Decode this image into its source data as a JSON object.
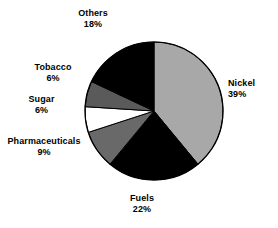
{
  "chart_data": {
    "type": "pie",
    "title": "",
    "subtitle": "",
    "xlabel": "",
    "ylabel": "",
    "legend_position": "none",
    "grid": false,
    "value_unit": "%",
    "categories": [
      "Nickel",
      "Fuels",
      "Pharmaceuticals",
      "Sugar",
      "Tobacco",
      "Others"
    ],
    "values": [
      39,
      22,
      9,
      6,
      6,
      18
    ],
    "labels": [
      "39%",
      "22%",
      "9%",
      "6%",
      "6%",
      "18%"
    ],
    "colors": [
      "#a8a8a8",
      "#000000",
      "#696969",
      "#ffffff",
      "#5a5a5a",
      "#000000"
    ],
    "start_angle_deg": 0,
    "direction": "clockwise",
    "slices": [
      {
        "name": "Nickel",
        "value": 39,
        "label": "39%",
        "color": "#a8a8a8",
        "text_align": "left"
      },
      {
        "name": "Fuels",
        "value": 22,
        "label": "22%",
        "color": "#000000",
        "text_align": "center"
      },
      {
        "name": "Pharmaceuticals",
        "value": 9,
        "label": "9%",
        "color": "#696969",
        "text_align": "center"
      },
      {
        "name": "Sugar",
        "value": 6,
        "label": "6%",
        "color": "#ffffff",
        "text_align": "center"
      },
      {
        "name": "Tobacco",
        "value": 6,
        "label": "6%",
        "color": "#5a5a5a",
        "text_align": "center"
      },
      {
        "name": "Others",
        "value": 18,
        "label": "18%",
        "color": "#000000",
        "text_align": "center"
      }
    ],
    "geometry": {
      "cx": 154,
      "cy": 111,
      "r": 69
    },
    "background": "#ffffff",
    "outline_color": "#000000"
  }
}
